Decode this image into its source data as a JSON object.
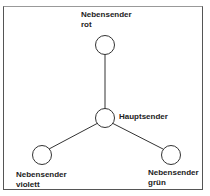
{
  "diagram": {
    "type": "star-network",
    "center": {
      "id": "hauptsender",
      "label": "Hauptsender"
    },
    "nodes": [
      {
        "id": "rot",
        "line1": "Nebensender",
        "line2": "rot"
      },
      {
        "id": "violett",
        "line1": "Nebensender",
        "line2": "violett"
      },
      {
        "id": "gruen",
        "line1": "Nebensender",
        "line2": "grün"
      }
    ],
    "edges": [
      [
        "hauptsender",
        "rot"
      ],
      [
        "hauptsender",
        "violett"
      ],
      [
        "hauptsender",
        "gruen"
      ]
    ]
  }
}
